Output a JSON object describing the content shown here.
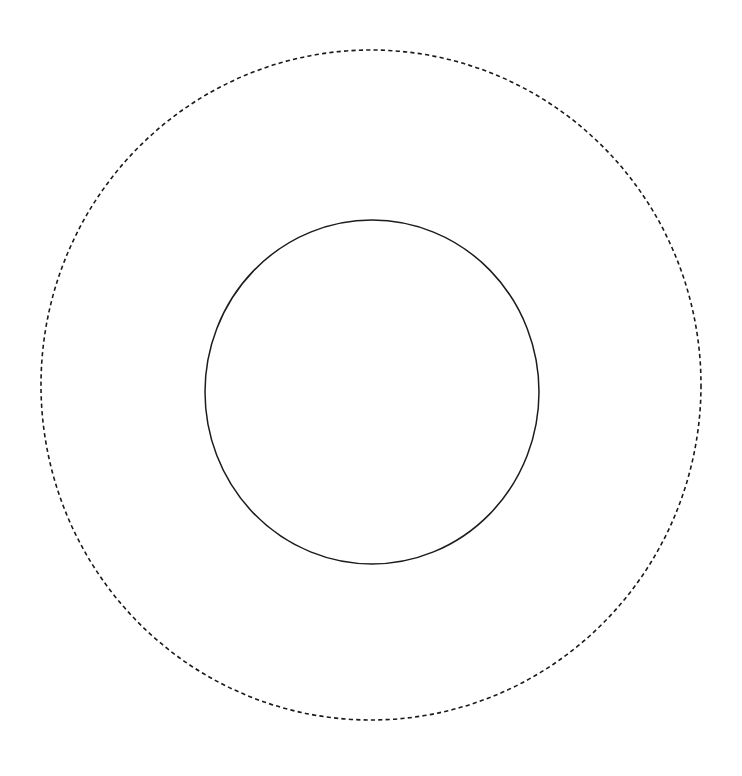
{
  "canvas": {
    "width": 742,
    "height": 776,
    "background_color": "#ffffff"
  },
  "diagram": {
    "shape_count": "2"
  },
  "shapes": [
    {
      "name": "outer-dashed-circle",
      "type": "ellipse",
      "center_x": 371,
      "center_y": 385,
      "radius_x": 330,
      "radius_y": 335,
      "stroke_color": "#1a1a1a",
      "stroke_width": 1.6,
      "stroke_style": "dashed",
      "dash_length": 4.2,
      "dash_gap": 3.2,
      "fill": "none"
    },
    {
      "name": "inner-solid-circle",
      "type": "ellipse",
      "center_x": 372,
      "center_y": 392,
      "radius_x": 167,
      "radius_y": 172,
      "stroke_color": "#1c1c1c",
      "stroke_width": 1.5,
      "stroke_style": "solid",
      "dash_length": 0,
      "dash_gap": 0,
      "fill": "none"
    }
  ],
  "chart_data": {
    "type": "scatter",
    "title": "",
    "xlabel": "",
    "ylabel": "",
    "grid": false,
    "legend": "none",
    "xlim": [
      0,
      742
    ],
    "ylim": [
      0,
      776
    ],
    "series": [
      {
        "name": "outer-dashed-circle",
        "geometry": "circle",
        "center": [
          371,
          385
        ],
        "radius": [
          330,
          335
        ],
        "linestyle": "dashed",
        "color": "#1a1a1a"
      },
      {
        "name": "inner-solid-circle",
        "geometry": "circle",
        "center": [
          372,
          392
        ],
        "radius": [
          167,
          172
        ],
        "linestyle": "solid",
        "color": "#1c1c1c"
      }
    ]
  }
}
